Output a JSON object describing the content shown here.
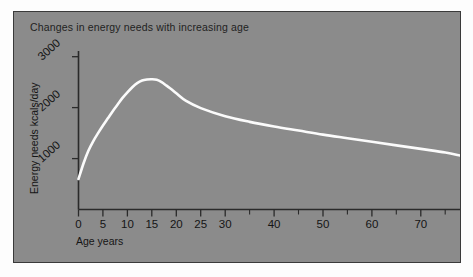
{
  "figure": {
    "panel_background": "#8b8b8b",
    "page_background": "#fdfdfd",
    "border_color": "#3a3a3a"
  },
  "chart_data": {
    "type": "line",
    "title": "Changes in energy needs with increasing age",
    "xlabel": "Age  years",
    "ylabel": "Energy needs  kcals/day",
    "xlim": [
      0,
      78
    ],
    "ylim": [
      0,
      3200
    ],
    "grid": false,
    "legend": null,
    "line_color": "#fbfbfb",
    "x_ticks_major": [
      0,
      5,
      10,
      15,
      20,
      25,
      30,
      40,
      50,
      60,
      70
    ],
    "x_tick_labels": [
      "0",
      "5",
      "10",
      "15",
      "20",
      "25",
      "30",
      "40",
      "50",
      "60",
      "70"
    ],
    "x_ticks_minor": [
      35,
      45,
      55,
      65,
      75
    ],
    "y_ticks": [
      1000,
      2000,
      3000
    ],
    "y_tick_labels": [
      "1000",
      "2000",
      "3000"
    ],
    "series": [
      {
        "name": "Energy needs",
        "x": [
          0,
          1,
          2,
          3,
          4,
          5,
          6,
          7,
          8,
          9,
          10,
          11,
          12,
          13,
          14,
          15,
          16,
          17,
          18,
          19,
          20,
          22,
          25,
          30,
          35,
          40,
          45,
          50,
          55,
          60,
          65,
          70,
          75,
          78
        ],
        "y": [
          600,
          900,
          1150,
          1340,
          1500,
          1650,
          1790,
          1930,
          2060,
          2190,
          2300,
          2400,
          2480,
          2530,
          2550,
          2555,
          2545,
          2500,
          2430,
          2360,
          2280,
          2130,
          1990,
          1830,
          1720,
          1630,
          1550,
          1470,
          1400,
          1330,
          1260,
          1190,
          1120,
          1060
        ]
      }
    ],
    "annotations": []
  }
}
